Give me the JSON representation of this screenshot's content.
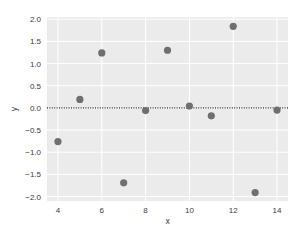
{
  "chart_data": {
    "type": "scatter",
    "title": "",
    "xlabel": "x",
    "ylabel": "y",
    "xlim": [
      3.5,
      14.5
    ],
    "ylim": [
      -2.1,
      2.05
    ],
    "grid": true,
    "legend": null,
    "x_ticks": [
      4,
      6,
      8,
      10,
      12,
      14
    ],
    "x_tick_labels": [
      "4",
      "6",
      "8",
      "10",
      "12",
      "14"
    ],
    "y_ticks": [
      2.0,
      1.5,
      1.0,
      0.5,
      0.0,
      -0.5,
      -1.0,
      -1.5,
      -2.0
    ],
    "y_tick_labels": [
      "2.0",
      "1.5",
      "1.0",
      "0.5",
      "0.0",
      "−0.5",
      "−1.0",
      "−1.5",
      "−2.0"
    ],
    "x": [
      4,
      5,
      6,
      7,
      8,
      9,
      10,
      11,
      12,
      13,
      14
    ],
    "y": [
      -0.76,
      0.19,
      1.24,
      -1.69,
      -0.06,
      1.3,
      0.04,
      -0.18,
      1.84,
      -1.91,
      -0.05
    ],
    "reference_line": {
      "orientation": "horizontal",
      "y": 0.0,
      "style": "dotted",
      "color": "#222222"
    },
    "colors": {
      "plot_background": "#ebebeb",
      "grid": "#ffffff",
      "marker": "#6f6f6f"
    }
  }
}
